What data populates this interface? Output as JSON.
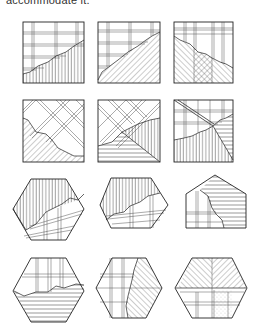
{
  "caption": {
    "text": "accommodate it."
  },
  "figure": {
    "rows": [
      {
        "shape": "square",
        "items": [
          {
            "id": "sq-1",
            "upper": "rectangular grid",
            "lower": "vertical hatching",
            "boundary": "jagged diagonal rising left-to-right"
          },
          {
            "id": "sq-2",
            "upper": "rectangular grid",
            "lower": "diagonal hatching",
            "boundary": "jagged diagonal rising left-to-right"
          },
          {
            "id": "sq-3",
            "upper": "vertical grid",
            "lower": "herringbone diagonal hatching",
            "boundary": "jagged diagonal falling left-to-right"
          }
        ]
      },
      {
        "shape": "square",
        "items": [
          {
            "id": "sq-4",
            "upper": "diagonal lattice",
            "lower": "diagonal hatching",
            "boundary": "jagged diagonal"
          },
          {
            "id": "sq-5",
            "upper": "diagonal lattice",
            "lower": "horizontal and vertical hatching",
            "boundary": "diagonal"
          },
          {
            "id": "sq-6",
            "upper": "rectangular grid with diagonal band",
            "lower": "horizontal and vertical hatching",
            "boundary": "jagged curve"
          }
        ]
      },
      {
        "shape": "hexagon/pentagon",
        "items": [
          {
            "id": "hex-1",
            "upper": "vertical hatching",
            "lower": "rectangular grid",
            "boundary": "jagged diagonal"
          },
          {
            "id": "hex-2",
            "upper": "vertical hatching",
            "lower": "rectangular grid",
            "boundary": "jagged diagonal"
          },
          {
            "id": "house-1",
            "upper": "horizontal hatching",
            "lower": "rectangular grid",
            "boundary": "jagged vertical"
          }
        ]
      },
      {
        "shape": "hexagon",
        "items": [
          {
            "id": "hex-3",
            "upper": "rectangular grid",
            "lower": "horizontal hatching",
            "boundary": "jagged horizontal"
          },
          {
            "id": "hex-4",
            "upper": "rectangular grid",
            "lower": "diagonal hatching",
            "boundary": "jagged vertical"
          },
          {
            "id": "hex-5",
            "upper": "herringbone diagonal hatching",
            "lower": "rectangular grid with stippled panel",
            "boundary": "horizontal"
          }
        ]
      }
    ]
  },
  "colors": {
    "ink": "#222222",
    "background": "#ffffff"
  }
}
